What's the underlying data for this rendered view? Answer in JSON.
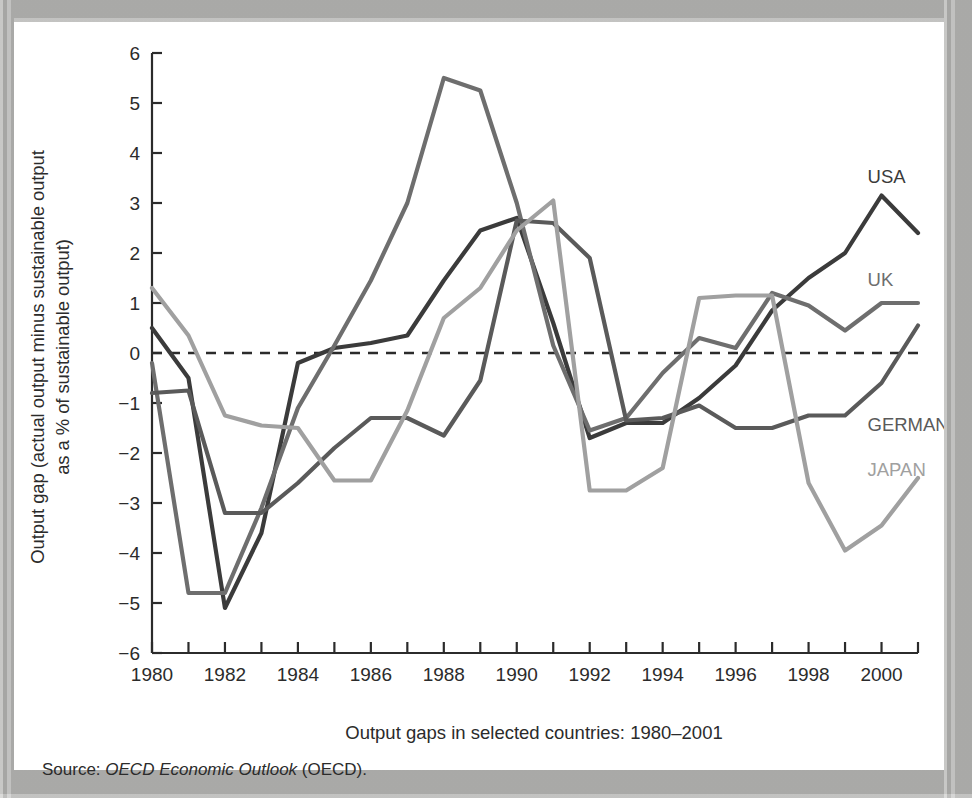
{
  "figure": {
    "caption": "Output gaps in selected countries: 1980–2001",
    "source_prefix": "Source: ",
    "source_italic": "OECD Economic Outlook",
    "source_suffix": " (OECD).",
    "y_axis_line1": "Output gap (actual output minus sustainable output",
    "y_axis_line2": "as a % of sustainable output)"
  },
  "chart_data": {
    "type": "line",
    "title": "Output gaps in selected countries: 1980–2001",
    "xlabel": "",
    "ylabel": "Output gap (actual output minus sustainable output as a % of sustainable output)",
    "xlim": [
      1980,
      2001
    ],
    "ylim": [
      -6,
      6
    ],
    "ytick_values": [
      6,
      5,
      4,
      3,
      2,
      1,
      0,
      -1,
      -2,
      -3,
      -4,
      -5,
      -6
    ],
    "ytick_labels": [
      "6",
      "5",
      "4",
      "3",
      "2",
      "1",
      "0",
      "−1",
      "−2",
      "−3",
      "−4",
      "−5",
      "−6"
    ],
    "x": [
      1980,
      1981,
      1982,
      1983,
      1984,
      1985,
      1986,
      1987,
      1988,
      1989,
      1990,
      1991,
      1992,
      1993,
      1994,
      1995,
      1996,
      1997,
      1998,
      1999,
      2000,
      2001
    ],
    "xtick_values": [
      1980,
      1981,
      1982,
      1983,
      1984,
      1985,
      1986,
      1987,
      1988,
      1989,
      1990,
      1991,
      1992,
      1993,
      1994,
      1995,
      1996,
      1997,
      1998,
      1999,
      2000,
      2001
    ],
    "xtick_labels_shown": [
      "1980",
      "1982",
      "1984",
      "1986",
      "1988",
      "1990",
      "1992",
      "1994",
      "1996",
      "1998",
      "2000"
    ],
    "zero_line": 0,
    "zero_line_style": "dashed",
    "grid": false,
    "legend_position": "inline-right-of-series",
    "series": [
      {
        "name": "USA",
        "color": "#3b3b3b",
        "label_x": 2000,
        "label_y": 3.4,
        "values": [
          0.5,
          -0.5,
          -5.1,
          -3.6,
          -0.2,
          0.1,
          0.2,
          0.35,
          1.45,
          2.45,
          2.7,
          0.6,
          -1.7,
          -1.4,
          -1.4,
          -0.9,
          -0.25,
          0.85,
          1.5,
          2.0,
          3.15,
          2.4
        ]
      },
      {
        "name": "UK",
        "color": "#6e6e6e",
        "label_x": 2000,
        "label_y": 1.35,
        "values": [
          -0.2,
          -4.8,
          -4.8,
          -3.1,
          -1.1,
          0.15,
          1.45,
          3.0,
          5.5,
          5.25,
          3.0,
          0.15,
          -1.55,
          -1.3,
          -0.4,
          0.3,
          0.1,
          1.2,
          0.95,
          0.45,
          1.0,
          1.0
        ]
      },
      {
        "name": "GERMANY",
        "color": "#5a5a5a",
        "label_x": 2000,
        "label_y": -1.55,
        "values": [
          -0.8,
          -0.75,
          -3.2,
          -3.2,
          -2.6,
          -1.9,
          -1.3,
          -1.3,
          -1.65,
          -0.55,
          2.65,
          2.6,
          1.9,
          -1.35,
          -1.3,
          -1.05,
          -1.5,
          -1.5,
          -1.25,
          -1.25,
          -0.6,
          0.55
        ]
      },
      {
        "name": "JAPAN",
        "color": "#a0a0a0",
        "label_x": 2000,
        "label_y": -2.45,
        "values": [
          1.3,
          0.35,
          -1.25,
          -1.45,
          -1.5,
          -2.55,
          -2.55,
          -1.15,
          0.7,
          1.3,
          2.45,
          3.05,
          -2.75,
          -2.75,
          -2.3,
          1.1,
          1.15,
          1.15,
          -2.6,
          -3.95,
          -3.45,
          -2.5
        ]
      }
    ]
  }
}
